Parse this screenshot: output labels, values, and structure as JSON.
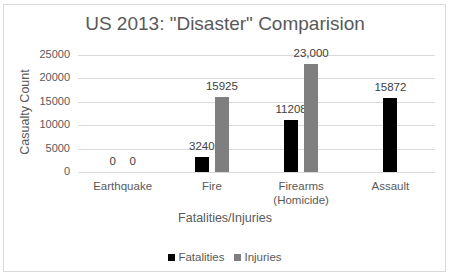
{
  "cropped_top_text": "Chart 1: Disaster Casualty Comparison",
  "chart_data": {
    "type": "bar",
    "title": "US 2013: \"Disaster\" Comparision",
    "xlabel": "Fatalities/Injuries",
    "ylabel": "Casualty Count",
    "ylim": [
      0,
      25000
    ],
    "yticks": [
      "0",
      "5000",
      "10000",
      "15000",
      "20000",
      "25000"
    ],
    "grid": true,
    "legend_position": "bottom",
    "categories": [
      "Earthquake",
      "Fire",
      "Firearms (Homicide)",
      "Assault"
    ],
    "category_lines": [
      [
        "Earthquake"
      ],
      [
        "Fire"
      ],
      [
        "Firearms",
        "(Homicide)"
      ],
      [
        "Assault"
      ]
    ],
    "series": [
      {
        "name": "Fatalities",
        "color": "#000000",
        "values": [
          0,
          3240,
          11208,
          15872
        ],
        "labels": [
          "0",
          "3240",
          "11208",
          "15872"
        ]
      },
      {
        "name": "Injuries",
        "color": "#7f7f7f",
        "values": [
          0,
          15925,
          23000,
          null
        ],
        "labels": [
          "0",
          "15925",
          "23,000",
          ""
        ]
      }
    ]
  },
  "legend": {
    "items": [
      {
        "label": "Fatalities",
        "color": "#000000"
      },
      {
        "label": "Injuries",
        "color": "#7f7f7f"
      }
    ]
  }
}
